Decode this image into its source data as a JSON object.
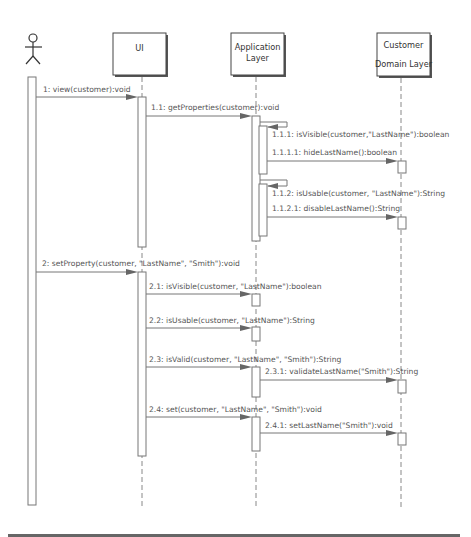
{
  "diagram": {
    "type": "UML sequence diagram",
    "actor": {
      "name": "user-actor"
    },
    "participants": [
      {
        "id": "ui",
        "label_lines": [
          "UI"
        ]
      },
      {
        "id": "app",
        "label_lines": [
          "Application",
          "Layer"
        ]
      },
      {
        "id": "customer",
        "label_lines": [
          "Customer",
          "Domain Layer"
        ]
      }
    ],
    "messages": [
      {
        "id": "m1",
        "label": "1: view(customer):void",
        "from": "actor",
        "to": "ui"
      },
      {
        "id": "m1_1",
        "label": "1.1: getProperties(customer):void",
        "from": "ui",
        "to": "app"
      },
      {
        "id": "m1_1_1",
        "label": "1.1.1: isVisible(customer,\"LastName\"):boolean",
        "from": "app",
        "to": "app"
      },
      {
        "id": "m1_1_1_1",
        "label": "1.1.1.1: hideLastName():boolean",
        "from": "app",
        "to": "customer"
      },
      {
        "id": "m1_1_2",
        "label": "1.1.2: isUsable(customer, \"LastName\"):String",
        "from": "app",
        "to": "app"
      },
      {
        "id": "m1_1_2_1",
        "label": "1.1.2.1: disableLastName():String",
        "from": "app",
        "to": "customer"
      },
      {
        "id": "m2",
        "label": "2: setProperty(customer, \"LastName\", \"Smith\"):void",
        "from": "actor",
        "to": "ui"
      },
      {
        "id": "m2_1",
        "label": "2.1: isVisible(customer, \"LastName\"):boolean",
        "from": "ui",
        "to": "app"
      },
      {
        "id": "m2_2",
        "label": "2.2: isUsable(customer, \"LastName\"):String",
        "from": "ui",
        "to": "app"
      },
      {
        "id": "m2_3",
        "label": "2.3: isValid(customer, \"LastName\", \"Smith\"):String",
        "from": "ui",
        "to": "app"
      },
      {
        "id": "m2_3_1",
        "label": "2.3.1: validateLastName(\"Smith\"):String",
        "from": "app",
        "to": "customer"
      },
      {
        "id": "m2_4",
        "label": "2.4: set(customer, \"LastName\", \"Smith\"):void",
        "from": "ui",
        "to": "app"
      },
      {
        "id": "m2_4_1",
        "label": "2.4.1: setLastName(\"Smith\"):void",
        "from": "app",
        "to": "customer"
      }
    ]
  }
}
